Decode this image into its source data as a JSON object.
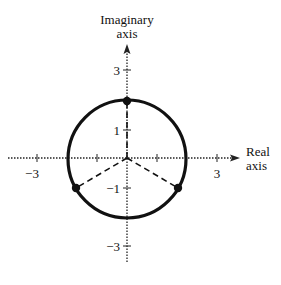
{
  "diagram": {
    "y_axis_label_line1": "Imaginary",
    "y_axis_label_line2": "axis",
    "x_axis_label_line1": "Real",
    "x_axis_label_line2": "axis",
    "x_ticks": {
      "neg3": "−3",
      "pos3": "3"
    },
    "y_ticks": {
      "pos3": "3",
      "pos1": "1",
      "neg1": "−1",
      "neg3": "−3"
    },
    "circle": {
      "center": [
        0,
        0
      ],
      "radius": 2
    },
    "points": [
      {
        "label": "top",
        "re": 0,
        "im": 2
      },
      {
        "label": "lower-left",
        "re": -1.732,
        "im": -1
      },
      {
        "label": "lower-right",
        "re": 1.732,
        "im": -1
      }
    ],
    "colors": {
      "ink": "#111111",
      "background": "#ffffff"
    }
  }
}
